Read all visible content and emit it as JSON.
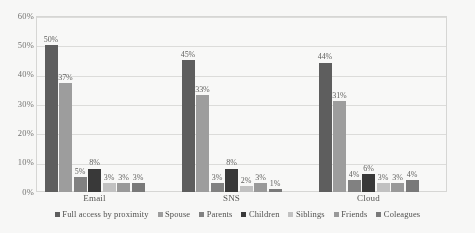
{
  "chart_data": {
    "type": "bar",
    "title": "",
    "xlabel": "",
    "ylabel": "",
    "ylim": [
      0,
      60
    ],
    "yticks": [
      "0%",
      "10%",
      "20%",
      "30%",
      "40%",
      "50%",
      "60%"
    ],
    "ytick_values": [
      0,
      10,
      20,
      30,
      40,
      50,
      60
    ],
    "grid": true,
    "legend_position": "bottom",
    "value_suffix": "%",
    "categories": [
      "Email",
      "SNS",
      "Cloud"
    ],
    "series": [
      {
        "name": "Full access by proximity",
        "color": "#5a5a5a",
        "values": [
          50,
          45,
          44
        ],
        "labels": [
          "50%",
          "45%",
          "44%"
        ]
      },
      {
        "name": "Spouse",
        "color": "#9c9c9c",
        "values": [
          37,
          33,
          31
        ],
        "labels": [
          "37%",
          "33%",
          "31%"
        ]
      },
      {
        "name": "Parents",
        "color": "#7e7e7e",
        "values": [
          5,
          3,
          4
        ],
        "labels": [
          "5%",
          "3%",
          "4%"
        ]
      },
      {
        "name": "Children",
        "color": "#333333",
        "values": [
          8,
          8,
          6
        ],
        "labels": [
          "8%",
          "8%",
          "6%"
        ]
      },
      {
        "name": "Siblings",
        "color": "#c2c2c2",
        "values": [
          3,
          2,
          3
        ],
        "labels": [
          "3%",
          "2%",
          "3%"
        ]
      },
      {
        "name": "Friends",
        "color": "#989898",
        "values": [
          3,
          3,
          3
        ],
        "labels": [
          "3%",
          "3%",
          "3%"
        ]
      },
      {
        "name": "Coleagues",
        "color": "#767676",
        "values": [
          3,
          1,
          4
        ],
        "labels": [
          "3%",
          "1%",
          "4%"
        ]
      }
    ]
  }
}
